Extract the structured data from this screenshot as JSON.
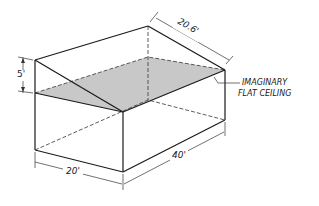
{
  "diagram": {
    "type": "isometric room with sloped ceiling",
    "colors": {
      "line": "#1a1a1a",
      "ceiling_fill": "#c8c8c8",
      "background": "#ffffff"
    },
    "dimensions": {
      "height_difference": "5'",
      "slope_length": "20.6'",
      "width": "20'",
      "length": "40'"
    },
    "callout": {
      "line1": "IMAGINARY",
      "line2": "FLAT CEILING"
    }
  }
}
